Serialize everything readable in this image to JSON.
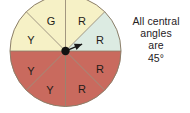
{
  "figure": {
    "name": "spinner-diagram",
    "type": "pie",
    "caption": {
      "lines": [
        "All central",
        "angles",
        "are",
        "45°"
      ],
      "full_text": "All central angles are 45°"
    }
  },
  "colors": {
    "red": "#c96a5e",
    "yellow": "#f6f1c6",
    "green": "#dcebe2",
    "outline": "#8c7f6a",
    "divider": "#8c7f6a",
    "pivot": "#121212",
    "arrow": "#1a1a1a",
    "background": "#ffffff",
    "label_text": "#241c18",
    "caption_text": "#26211e"
  },
  "chart_data": {
    "type": "pie",
    "title": "",
    "xlabel": "",
    "ylabel": "",
    "legend": "none",
    "grid": false,
    "total_sectors": 8,
    "central_angle_each_deg": 45,
    "categories": [
      "R",
      "R",
      "R",
      "R",
      "Y",
      "Y",
      "Y",
      "G"
    ],
    "values": [
      45,
      45,
      45,
      45,
      45,
      45,
      45,
      45
    ],
    "counts": {
      "R": 4,
      "Y": 3,
      "G": 1
    },
    "sectors": [
      {
        "id": "sector-r-1",
        "label": "R",
        "color": "#c96a5e",
        "start_deg": 0,
        "end_deg": 45,
        "label_x": 82,
        "label_y": 22
      },
      {
        "id": "sector-r-2",
        "label": "R",
        "color": "#c96a5e",
        "start_deg": 45,
        "end_deg": 90,
        "label_x": 100,
        "label_y": 41
      },
      {
        "id": "sector-r-3",
        "label": "R",
        "color": "#c96a5e",
        "start_deg": 90,
        "end_deg": 135,
        "label_x": 100,
        "label_y": 70
      },
      {
        "id": "sector-r-4",
        "label": "R",
        "color": "#c96a5e",
        "start_deg": 135,
        "end_deg": 180,
        "label_x": 82,
        "label_y": 90
      },
      {
        "id": "sector-y-1",
        "label": "Y",
        "color": "#f6f1c6",
        "start_deg": 180,
        "end_deg": 225,
        "label_x": 50,
        "label_y": 91
      },
      {
        "id": "sector-y-2",
        "label": "Y",
        "color": "#f6f1c6",
        "start_deg": 225,
        "end_deg": 270,
        "label_x": 31,
        "label_y": 72
      },
      {
        "id": "sector-y-3",
        "label": "Y",
        "color": "#f6f1c6",
        "start_deg": 270,
        "end_deg": 315,
        "label_x": 31,
        "label_y": 41
      },
      {
        "id": "sector-g-1",
        "label": "G",
        "color": "#dcebe2",
        "start_deg": 315,
        "end_deg": 360,
        "label_x": 51,
        "label_y": 22
      }
    ],
    "pointer": {
      "angle_deg": 22.5,
      "direction": "upper-right",
      "points_into": "R"
    },
    "geometry": {
      "center_x": 65.5,
      "center_y": 51,
      "radius": 55.5
    }
  }
}
